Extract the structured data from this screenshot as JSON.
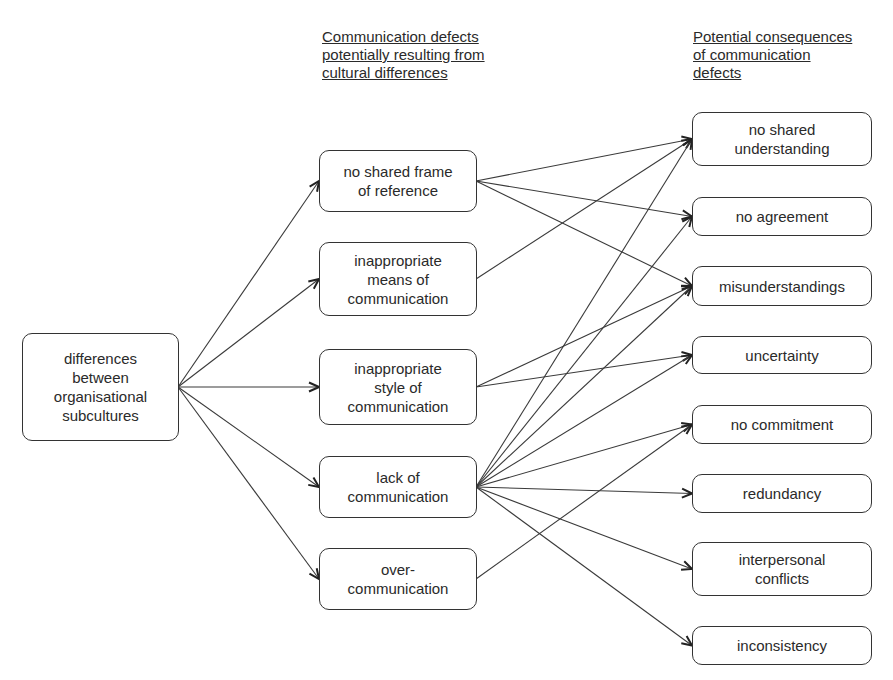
{
  "headings": {
    "middle": [
      "Communication defects",
      "potentially resulting from",
      "cultural differences"
    ],
    "right": [
      "Potential consequences",
      "of communication",
      "defects"
    ]
  },
  "source": {
    "id": "differences",
    "lines": [
      "differences",
      "between",
      "organisational",
      "subcultures"
    ]
  },
  "defects": [
    {
      "id": "no-shared-frame",
      "lines": [
        "no shared frame",
        "of reference"
      ]
    },
    {
      "id": "inappropriate-means",
      "lines": [
        "inappropriate",
        "means of",
        "communication"
      ]
    },
    {
      "id": "inappropriate-style",
      "lines": [
        "inappropriate",
        "style of",
        "communication"
      ]
    },
    {
      "id": "lack-of-communication",
      "lines": [
        "lack of",
        "communication"
      ]
    },
    {
      "id": "over-communication",
      "lines": [
        "over-",
        "communication"
      ]
    }
  ],
  "consequences": [
    {
      "id": "no-shared-understanding",
      "lines": [
        "no shared",
        "understanding"
      ]
    },
    {
      "id": "no-agreement",
      "lines": [
        "no agreement"
      ]
    },
    {
      "id": "misunderstandings",
      "lines": [
        "misunderstandings"
      ]
    },
    {
      "id": "uncertainty",
      "lines": [
        "uncertainty"
      ]
    },
    {
      "id": "no-commitment",
      "lines": [
        "no commitment"
      ]
    },
    {
      "id": "redundancy",
      "lines": [
        "redundancy"
      ]
    },
    {
      "id": "interpersonal-conflicts",
      "lines": [
        "interpersonal",
        "conflicts"
      ]
    },
    {
      "id": "inconsistency",
      "lines": [
        "inconsistency"
      ]
    }
  ],
  "edges": [
    [
      "differences",
      "no-shared-frame"
    ],
    [
      "differences",
      "inappropriate-means"
    ],
    [
      "differences",
      "inappropriate-style"
    ],
    [
      "differences",
      "lack-of-communication"
    ],
    [
      "differences",
      "over-communication"
    ],
    [
      "no-shared-frame",
      "no-shared-understanding"
    ],
    [
      "no-shared-frame",
      "no-agreement"
    ],
    [
      "no-shared-frame",
      "misunderstandings"
    ],
    [
      "inappropriate-means",
      "no-shared-understanding"
    ],
    [
      "inappropriate-style",
      "misunderstandings"
    ],
    [
      "inappropriate-style",
      "uncertainty"
    ],
    [
      "lack-of-communication",
      "no-shared-understanding"
    ],
    [
      "lack-of-communication",
      "no-agreement"
    ],
    [
      "lack-of-communication",
      "misunderstandings"
    ],
    [
      "lack-of-communication",
      "uncertainty"
    ],
    [
      "lack-of-communication",
      "no-commitment"
    ],
    [
      "lack-of-communication",
      "redundancy"
    ],
    [
      "lack-of-communication",
      "interpersonal-conflicts"
    ],
    [
      "lack-of-communication",
      "inconsistency"
    ],
    [
      "over-communication",
      "no-commitment"
    ]
  ],
  "colors": {
    "stroke": "#333333",
    "text": "#2a2a2a",
    "background": "#ffffff"
  }
}
